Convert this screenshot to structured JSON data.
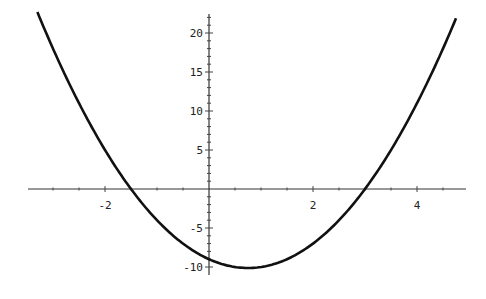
{
  "chart_data": {
    "type": "line",
    "title": "",
    "xlabel": "",
    "ylabel": "",
    "function": "y = 2x^2 - 3x - 9",
    "xlim": [
      -3.4,
      4.9
    ],
    "ylim": [
      -10.5,
      22.5
    ],
    "grid": false,
    "legend": null,
    "x_ticks": [
      -2,
      2,
      4
    ],
    "x_tick_labels": [
      "-2",
      "2",
      "4"
    ],
    "y_ticks": [
      -10,
      -5,
      5,
      10,
      15,
      20
    ],
    "y_tick_labels": [
      "-10",
      "-5",
      "5",
      "10",
      "15",
      "20"
    ],
    "series": [
      {
        "name": "curve",
        "color": "#111111",
        "x": [
          -3.3,
          -3,
          -2.5,
          -2,
          -1.5,
          -1,
          -0.5,
          0,
          0.5,
          0.75,
          1,
          1.5,
          2,
          2.5,
          3,
          3.5,
          4,
          4.5,
          4.75
        ],
        "y": [
          22.68,
          18,
          11,
          5,
          0,
          -4,
          -7,
          -9,
          -10,
          -10.125,
          -10,
          -9,
          -7,
          -4,
          0,
          4,
          8,
          18,
          22.875
        ]
      }
    ],
    "roots": [
      -1.5,
      3
    ],
    "minimum": {
      "x": 0.75,
      "y": -10.125
    }
  }
}
